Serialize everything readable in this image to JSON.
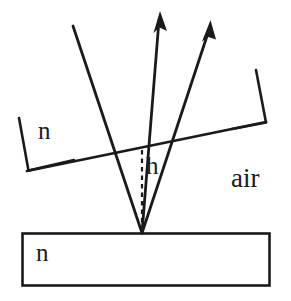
{
  "figure": {
    "type": "optics-ray-diagram",
    "background_color": "#ffffff",
    "stroke_color": "#1a1a1a"
  },
  "labels": {
    "medium_left": "n",
    "height": "h",
    "ambient": "air",
    "substrate": "n"
  },
  "geometry": {
    "incident_ray": {
      "name": "incident-ray",
      "from": [
        73,
        26
      ],
      "to": [
        142,
        233
      ],
      "arrow": false
    },
    "reflected_ray_inner": {
      "name": "reflected-ray-inner",
      "from": [
        142,
        233
      ],
      "to": [
        160,
        12
      ],
      "arrow": true
    },
    "reflected_ray_outer": {
      "name": "reflected-ray-outer",
      "from": [
        142,
        233
      ],
      "to": [
        210,
        22
      ],
      "arrow": true
    },
    "interface_line": {
      "name": "film-interface-line",
      "from": [
        28,
        170
      ],
      "to": [
        265,
        122
      ]
    },
    "left_bracket": {
      "name": "left-thickness-bracket",
      "points": [
        [
          20,
          119
        ],
        [
          28,
          170
        ]
      ]
    },
    "right_bracket": {
      "name": "right-thickness-bracket",
      "points": [
        [
          258,
          71
        ],
        [
          265,
          122
        ]
      ]
    },
    "height_dashed_line": {
      "name": "height-dashed-line",
      "from": [
        142,
        150
      ],
      "to": [
        142,
        233
      ],
      "dashed": true
    },
    "substrate_rect": {
      "name": "substrate-rectangle",
      "x": 22,
      "y": 233,
      "width": 248,
      "height": 53
    }
  }
}
